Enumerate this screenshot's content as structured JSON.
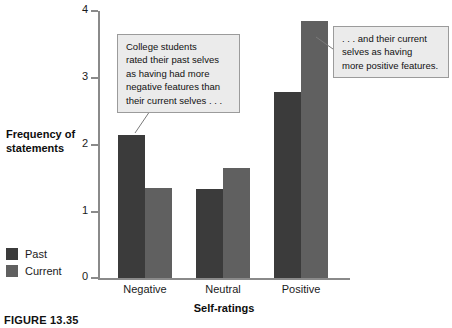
{
  "chart_data": {
    "type": "bar",
    "title": "",
    "xlabel": "Self-ratings",
    "ylabel": "Frequency of statements",
    "categories": [
      "Negative",
      "Neutral",
      "Positive"
    ],
    "series": [
      {
        "name": "Past",
        "color": "#3b3b3b",
        "values": [
          2.14,
          1.33,
          2.79
        ]
      },
      {
        "name": "Current",
        "color": "#606060",
        "values": [
          1.35,
          1.65,
          3.85
        ]
      }
    ],
    "ylim": [
      0,
      4
    ],
    "yticks": [
      0,
      1,
      2,
      3,
      4
    ],
    "ytick_labels": [
      "0",
      "1",
      "2",
      "3",
      "4"
    ],
    "grid": false,
    "legend_position": "left-bottom",
    "annotations": [
      "College students rated their past selves as having had more negative features than their current selves . . .",
      ". . . and their current selves as having more positive features."
    ]
  },
  "y_axis": {
    "title_line1": "Frequency of",
    "title_line2": "statements",
    "ticks": [
      "4",
      "3",
      "2",
      "1",
      "0"
    ]
  },
  "x_axis": {
    "title": "Self-ratings",
    "categories": [
      "Negative",
      "Neutral",
      "Positive"
    ]
  },
  "legend": {
    "items": [
      {
        "label": "Past",
        "color": "#3b3b3b"
      },
      {
        "label": "Current",
        "color": "#606060"
      }
    ]
  },
  "callouts": {
    "left": {
      "lines": [
        "College students",
        "rated their past selves",
        "as having had more",
        "negative features than",
        "their current selves . . ."
      ]
    },
    "right": {
      "lines": [
        ". . . and their current",
        "selves as having",
        "more positive features."
      ]
    }
  },
  "caption": {
    "text": "FIGURE 13.35"
  }
}
